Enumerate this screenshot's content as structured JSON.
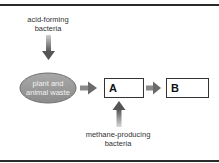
{
  "diagram": {
    "inputs": {
      "top": {
        "line1": "acid-forming",
        "line2": "bacteria"
      },
      "bottom": {
        "line1": "methane-producing",
        "line2": "bacteria"
      }
    },
    "source": {
      "line1": "plant and",
      "line2": "animal waste"
    },
    "boxes": [
      {
        "label": "A"
      },
      {
        "label": "B"
      }
    ],
    "colors": {
      "ellipse_fill": "#9a9a9a",
      "ellipse_stroke": "#6e6e6e",
      "arrow": "#707070",
      "box_stroke": "#333333",
      "frame": "#2a2a2a"
    }
  }
}
